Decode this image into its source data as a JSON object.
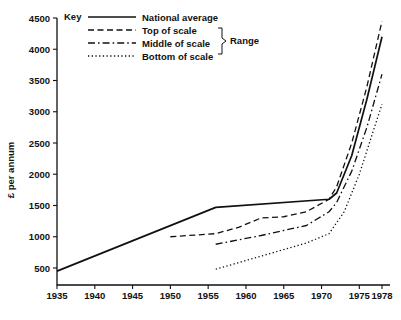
{
  "chart_data": {
    "type": "line",
    "title": "",
    "xlabel": "",
    "ylabel": "£ per annum",
    "xlim": [
      1935,
      1978
    ],
    "ylim": [
      0,
      4500
    ],
    "grid": false,
    "legend_position": "top-left-inside",
    "legend_title": "Key",
    "range_bracket_label": "Range",
    "x_ticks": [
      1935,
      1940,
      1945,
      1950,
      1955,
      1960,
      1965,
      1970,
      1975,
      1978
    ],
    "x_tick_labels": [
      "1935",
      "1940",
      "1945",
      "1950",
      "1955",
      "1960",
      "1965",
      "1970",
      "1975",
      "1978"
    ],
    "y_ticks": [
      500,
      1000,
      1500,
      2000,
      2500,
      3000,
      3500,
      4000,
      4500
    ],
    "y_tick_labels": [
      "500",
      "1000",
      "1500",
      "2000",
      "2500",
      "3000",
      "3500",
      "4000",
      "4500"
    ],
    "series": [
      {
        "name": "National average",
        "style": "solid",
        "x": [
          1935,
          1956,
          1971,
          1972,
          1974,
          1976,
          1978
        ],
        "values": [
          450,
          1470,
          1600,
          1700,
          2300,
          3200,
          4200
        ]
      },
      {
        "name": "Top of scale",
        "style": "dashed",
        "x": [
          1950,
          1956,
          1959,
          1962,
          1965,
          1968,
          1971,
          1972,
          1974,
          1976,
          1978
        ],
        "values": [
          1000,
          1050,
          1150,
          1300,
          1320,
          1400,
          1600,
          1800,
          2500,
          3400,
          4450
        ]
      },
      {
        "name": "Middle of scale",
        "style": "dashdot",
        "x": [
          1956,
          1959,
          1962,
          1965,
          1968,
          1971,
          1972,
          1974,
          1976,
          1978
        ],
        "values": [
          880,
          950,
          1020,
          1100,
          1180,
          1400,
          1550,
          2050,
          2750,
          3600
        ]
      },
      {
        "name": "Bottom of scale",
        "style": "dotted",
        "x": [
          1956,
          1960,
          1964,
          1968,
          1971,
          1973,
          1975,
          1977,
          1978
        ],
        "values": [
          480,
          620,
          760,
          900,
          1050,
          1400,
          2000,
          2750,
          3120
        ]
      }
    ]
  },
  "legend": {
    "title": "Key",
    "range_label": "Range",
    "entries": [
      {
        "label": "National average",
        "style": "solid"
      },
      {
        "label": "Top of scale",
        "style": "dashed"
      },
      {
        "label": "Middle of scale",
        "style": "dashdot"
      },
      {
        "label": "Bottom of scale",
        "style": "dotted"
      }
    ]
  },
  "axes": {
    "y_title": "£ per annum"
  }
}
